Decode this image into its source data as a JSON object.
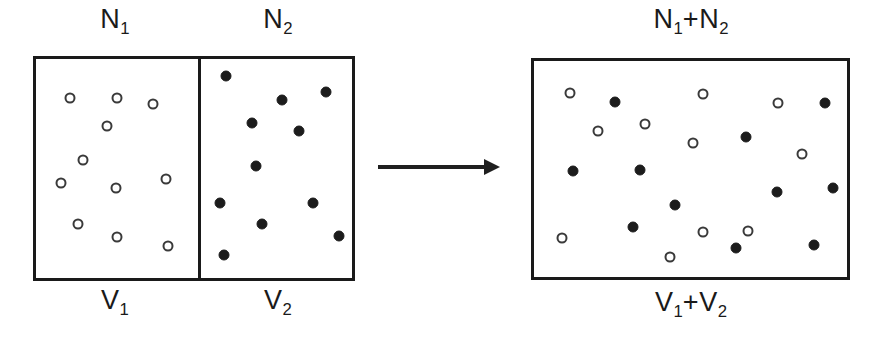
{
  "figure": {
    "width": 882,
    "height": 356,
    "ink_color": "#1a1a1a",
    "open_particle_color": "#ffffff",
    "filled_particle_color": "#1c1c1c",
    "background": "#ffffff"
  },
  "labels": {
    "left_top_chamber1": "N",
    "left_top_chamber1_sub": "1",
    "left_top_chamber2": "N",
    "left_top_chamber2_sub": "2",
    "left_bottom_chamber1": "V",
    "left_bottom_chamber1_sub": "1",
    "left_bottom_chamber2": "V",
    "left_bottom_chamber2_sub": "2",
    "right_top_part1": "N",
    "right_top_sub1": "1",
    "right_top_plus": "+N",
    "right_top_sub2": "2",
    "right_bottom_part1": "V",
    "right_bottom_sub1": "1",
    "right_bottom_plus": "+V",
    "right_bottom_sub2": "2"
  },
  "left_assembly": {
    "box": {
      "x": 33,
      "y": 56,
      "width": 322,
      "height": 225
    },
    "divider_x": 198,
    "chamber1": {
      "name": "chamber-1",
      "particle_type": "open",
      "particle_count": 11,
      "particles": [
        {
          "cx": 70,
          "cy": 98
        },
        {
          "cx": 117,
          "cy": 98
        },
        {
          "cx": 153,
          "cy": 104
        },
        {
          "cx": 107,
          "cy": 126
        },
        {
          "cx": 83,
          "cy": 160
        },
        {
          "cx": 61,
          "cy": 183
        },
        {
          "cx": 116,
          "cy": 188
        },
        {
          "cx": 166,
          "cy": 179
        },
        {
          "cx": 78,
          "cy": 224
        },
        {
          "cx": 117,
          "cy": 237
        },
        {
          "cx": 168,
          "cy": 246
        }
      ]
    },
    "chamber2": {
      "name": "chamber-2",
      "particle_type": "filled",
      "particle_count": 11,
      "particles": [
        {
          "cx": 226,
          "cy": 76
        },
        {
          "cx": 282,
          "cy": 100
        },
        {
          "cx": 326,
          "cy": 92
        },
        {
          "cx": 252,
          "cy": 123
        },
        {
          "cx": 299,
          "cy": 131
        },
        {
          "cx": 256,
          "cy": 166
        },
        {
          "cx": 220,
          "cy": 203
        },
        {
          "cx": 313,
          "cy": 203
        },
        {
          "cx": 262,
          "cy": 224
        },
        {
          "cx": 339,
          "cy": 236
        },
        {
          "cx": 224,
          "cy": 255
        }
      ]
    }
  },
  "arrow": {
    "name": "transformation-arrow",
    "x": 378,
    "y": 167,
    "length": 122
  },
  "right_assembly": {
    "box": {
      "x": 531,
      "y": 58,
      "width": 319,
      "height": 222
    },
    "open_particle_count": 11,
    "filled_particle_count": 11,
    "open_particles": [
      {
        "cx": 570,
        "cy": 93
      },
      {
        "cx": 703,
        "cy": 94
      },
      {
        "cx": 778,
        "cy": 103
      },
      {
        "cx": 598,
        "cy": 131
      },
      {
        "cx": 645,
        "cy": 124
      },
      {
        "cx": 693,
        "cy": 143
      },
      {
        "cx": 802,
        "cy": 154
      },
      {
        "cx": 748,
        "cy": 231
      },
      {
        "cx": 562,
        "cy": 238
      },
      {
        "cx": 703,
        "cy": 232
      },
      {
        "cx": 670,
        "cy": 257
      }
    ],
    "filled_particles": [
      {
        "cx": 615,
        "cy": 102
      },
      {
        "cx": 825,
        "cy": 103
      },
      {
        "cx": 746,
        "cy": 137
      },
      {
        "cx": 573,
        "cy": 171
      },
      {
        "cx": 640,
        "cy": 170
      },
      {
        "cx": 777,
        "cy": 192
      },
      {
        "cx": 833,
        "cy": 188
      },
      {
        "cx": 675,
        "cy": 205
      },
      {
        "cx": 633,
        "cy": 227
      },
      {
        "cx": 736,
        "cy": 248
      },
      {
        "cx": 814,
        "cy": 245
      }
    ]
  },
  "label_positions": {
    "N1": {
      "x": 115,
      "y": 4
    },
    "N2": {
      "x": 278,
      "y": 4
    },
    "V1": {
      "x": 115,
      "y": 285
    },
    "V2": {
      "x": 278,
      "y": 285
    },
    "N1N2": {
      "x": 691,
      "y": 4
    },
    "V1V2": {
      "x": 691,
      "y": 287
    }
  }
}
